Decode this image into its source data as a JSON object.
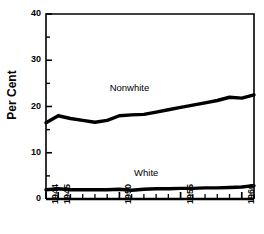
{
  "chart_data": {
    "type": "line",
    "title": "",
    "xlabel": "",
    "ylabel": "Per Cent",
    "xlim": [
      1944,
      1961
    ],
    "ylim": [
      0,
      40
    ],
    "grid": false,
    "legend_position": "inline-annotation",
    "y_ticks_major": [
      0,
      10,
      20,
      30,
      40
    ],
    "y_ticks_minor": [
      5,
      15,
      25,
      35
    ],
    "x_ticks_major": [
      1944,
      1945,
      1950,
      1955,
      1960
    ],
    "x_tick_labels": [
      "1944",
      "1945",
      "1950",
      "1955",
      "1960"
    ],
    "x_ticks_all": [
      1944,
      1945,
      1946,
      1947,
      1948,
      1949,
      1950,
      1951,
      1952,
      1953,
      1954,
      1955,
      1956,
      1957,
      1958,
      1959,
      1960,
      1961
    ],
    "x": [
      1944,
      1945,
      1946,
      1947,
      1948,
      1949,
      1950,
      1951,
      1952,
      1953,
      1954,
      1955,
      1956,
      1957,
      1958,
      1959,
      1960,
      1961
    ],
    "series": [
      {
        "name": "Nonwhite",
        "color": "#000000",
        "values": [
          16.5,
          18.0,
          17.4,
          17.0,
          16.6,
          17.0,
          18.0,
          18.2,
          18.3,
          18.8,
          19.3,
          19.8,
          20.3,
          20.8,
          21.3,
          22.0,
          21.8,
          22.5
        ]
      },
      {
        "name": "White",
        "color": "#000000",
        "values": [
          2.0,
          2.2,
          2.0,
          2.0,
          2.0,
          2.0,
          2.1,
          1.9,
          2.1,
          2.2,
          2.2,
          2.3,
          2.3,
          2.4,
          2.4,
          2.5,
          2.6,
          2.9
        ]
      }
    ],
    "annotations": [
      {
        "text": "Nonwhite",
        "x": 1951.0,
        "y": 23.8
      },
      {
        "text": "White",
        "x": 1953.0,
        "y": 5.4
      }
    ]
  },
  "axes": {
    "y_label": "Per Cent",
    "y_tick_labels": [
      "0",
      "10",
      "20",
      "30",
      "40"
    ]
  }
}
